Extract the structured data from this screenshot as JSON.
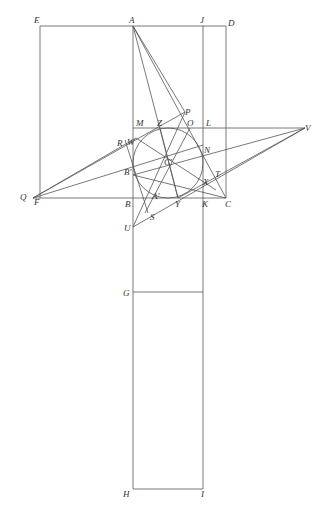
{
  "diagram": {
    "type": "geometric-construction",
    "points": {
      "E": {
        "label": "E",
        "x": 40,
        "y": 26,
        "lx": 34,
        "ly": 23
      },
      "A": {
        "label": "A",
        "x": 133,
        "y": 26,
        "lx": 129,
        "ly": 23
      },
      "J": {
        "label": "J",
        "x": 203,
        "y": 26,
        "lx": 200,
        "ly": 23
      },
      "D": {
        "label": "D",
        "x": 226,
        "y": 26,
        "lx": 228,
        "ly": 26
      },
      "M": {
        "label": "M",
        "x": 133,
        "y": 128,
        "lx": 136,
        "ly": 126
      },
      "Z": {
        "label": "Z",
        "x": 160,
        "y": 128,
        "lx": 157,
        "ly": 126
      },
      "O": {
        "label": "O",
        "x": 190,
        "y": 128,
        "lx": 187,
        "ly": 126
      },
      "L": {
        "label": "L",
        "x": 203,
        "y": 128,
        "lx": 206,
        "ly": 126
      },
      "P": {
        "label": "P",
        "x": 185,
        "y": 112,
        "lx": 185,
        "ly": 115
      },
      "V": {
        "label": "V",
        "x": 305,
        "y": 128,
        "lx": 305,
        "ly": 131
      },
      "R": {
        "label": "R",
        "x": 125,
        "y": 140,
        "lx": 117,
        "ly": 146
      },
      "W": {
        "label": "W",
        "x": 136,
        "y": 138,
        "lx": 127,
        "ly": 145
      },
      "N": {
        "label": "N",
        "x": 203,
        "y": 145,
        "lx": 204,
        "ly": 153
      },
      "Bp": {
        "label": "B'",
        "x": 133,
        "y": 175,
        "lx": 124,
        "ly": 175
      },
      "Cp": {
        "label": "C'",
        "x": 168,
        "y": 163,
        "lx": 164,
        "ly": 165
      },
      "T": {
        "label": "T",
        "x": 216,
        "y": 173,
        "lx": 215,
        "ly": 177
      },
      "X": {
        "label": "X",
        "x": 203,
        "y": 180,
        "lx": 203,
        "ly": 185
      },
      "Q": {
        "label": "Q",
        "x": 33,
        "y": 198,
        "lx": 20,
        "ly": 200
      },
      "F": {
        "label": "F",
        "x": 40,
        "y": 198,
        "lx": 34,
        "ly": 205
      },
      "B": {
        "label": "B",
        "x": 133,
        "y": 198,
        "lx": 125,
        "ly": 207
      },
      "Ap": {
        "label": "A'",
        "x": 150,
        "y": 195,
        "lx": 152,
        "ly": 199
      },
      "Y": {
        "label": "Y",
        "x": 178,
        "y": 198,
        "lx": 175,
        "ly": 207
      },
      "K": {
        "label": "K",
        "x": 203,
        "y": 198,
        "lx": 202,
        "ly": 207
      },
      "C": {
        "label": "C",
        "x": 226,
        "y": 198,
        "lx": 225,
        "ly": 207
      },
      "U": {
        "label": "U",
        "x": 133,
        "y": 227,
        "lx": 124,
        "ly": 231
      },
      "S": {
        "label": "S",
        "x": 148,
        "y": 213,
        "lx": 150,
        "ly": 220
      },
      "G": {
        "label": "G",
        "x": 133,
        "y": 292,
        "lx": 123,
        "ly": 296
      },
      "H": {
        "label": "H",
        "x": 133,
        "y": 489,
        "lx": 123,
        "ly": 497
      },
      "I": {
        "label": "I",
        "x": 203,
        "y": 489,
        "lx": 201,
        "ly": 497
      }
    },
    "circle": {
      "cx": 168,
      "cy": 163,
      "r": 35
    },
    "colors": {
      "stroke": "#555555",
      "label": "#333333",
      "background": "#ffffff"
    }
  }
}
